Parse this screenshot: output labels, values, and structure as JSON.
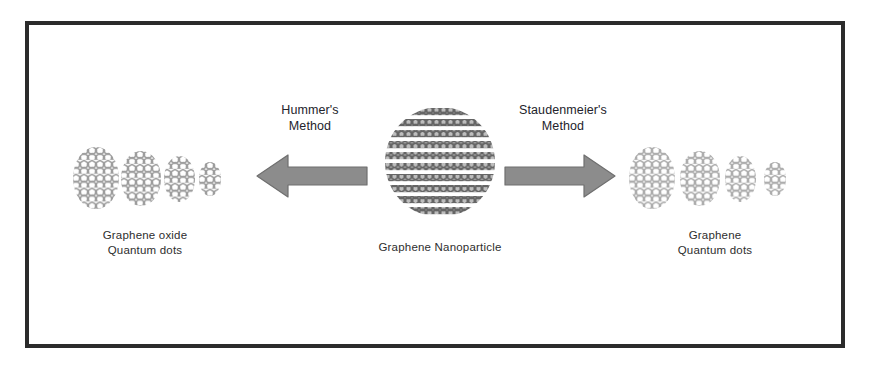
{
  "figure": {
    "background_color": "#ffffff",
    "border_color": "#2b2b2b"
  },
  "center": {
    "label": "Graphene Nanoparticle",
    "shape": "circle",
    "fill_color": "#6e6e6e",
    "lattice": "honeycomb-rows"
  },
  "left_branch": {
    "method_label": "Hummer's\nMethod",
    "arrow": {
      "direction": "left",
      "icon": "arrow-left-icon",
      "fill_color": "#8c8c8c",
      "stroke_color": "#6f6f6f"
    },
    "product_label": "Graphene oxide\nQuantum dots",
    "dot_color": "#a6a6a6",
    "dots": [
      {
        "name": "graphene-oxide-dot-1",
        "width": 46,
        "height": 62
      },
      {
        "name": "graphene-oxide-dot-2",
        "width": 40,
        "height": 55
      },
      {
        "name": "graphene-oxide-dot-3",
        "width": 31,
        "height": 46
      },
      {
        "name": "graphene-oxide-dot-4",
        "width": 22,
        "height": 34
      }
    ]
  },
  "right_branch": {
    "method_label": "Staudenmeier's\nMethod",
    "arrow": {
      "direction": "right",
      "icon": "arrow-right-icon",
      "fill_color": "#8c8c8c",
      "stroke_color": "#6f6f6f"
    },
    "product_label": "Graphene\nQuantum dots",
    "dot_color": "#b4b4b4",
    "dots": [
      {
        "name": "graphene-dot-1",
        "width": 46,
        "height": 62
      },
      {
        "name": "graphene-dot-2",
        "width": 40,
        "height": 55
      },
      {
        "name": "graphene-dot-3",
        "width": 31,
        "height": 46
      },
      {
        "name": "graphene-dot-4",
        "width": 22,
        "height": 34
      }
    ]
  }
}
